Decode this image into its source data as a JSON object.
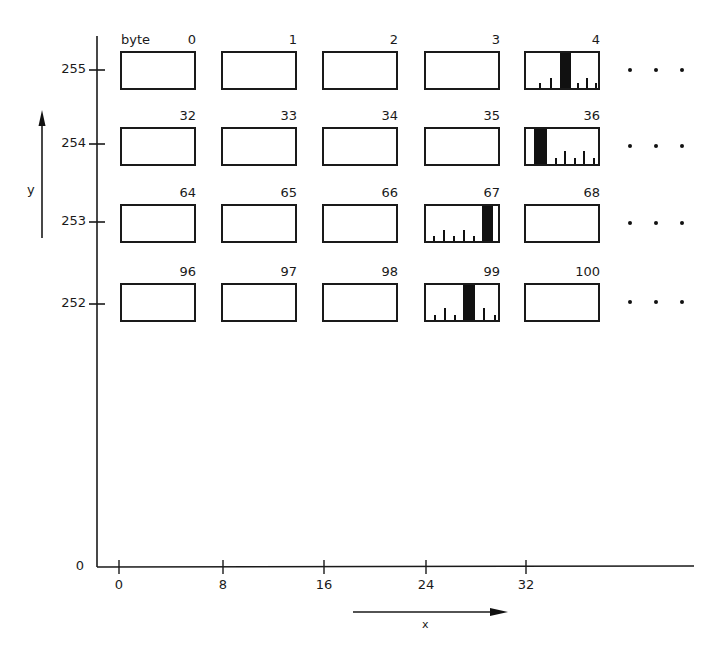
{
  "diagram": {
    "byte_label": "byte",
    "y_axis": {
      "label": "y",
      "ticks": [
        {
          "label": "255",
          "y": 70
        },
        {
          "label": "254",
          "y": 144
        },
        {
          "label": "253",
          "y": 222
        },
        {
          "label": "252",
          "y": 304
        },
        {
          "label": "0",
          "y": 567
        }
      ]
    },
    "x_axis": {
      "label": "x",
      "ticks": [
        {
          "label": "0",
          "x": 119
        },
        {
          "label": "8",
          "x": 223
        },
        {
          "label": "16",
          "x": 324
        },
        {
          "label": "24",
          "x": 426
        },
        {
          "label": "32",
          "x": 526
        }
      ]
    },
    "rows": [
      {
        "y_value": "255",
        "top": 51,
        "bytes": [
          {
            "num": "0"
          },
          {
            "num": "1"
          },
          {
            "num": "2"
          },
          {
            "num": "3"
          },
          {
            "num": "4",
            "pattern": {
              "bar_left": 34,
              "bar_width": 11,
              "ticks": [
                [
                  13,
                  5
                ],
                [
                  24,
                  10
                ],
                [
                  51,
                  5
                ],
                [
                  60,
                  10
                ],
                [
                  69,
                  5
                ]
              ]
            }
          }
        ],
        "ellipsis": "• • •"
      },
      {
        "y_value": "254",
        "top": 127,
        "bytes": [
          {
            "num": "32"
          },
          {
            "num": "33"
          },
          {
            "num": "34"
          },
          {
            "num": "35"
          },
          {
            "num": "36",
            "pattern": {
              "bar_left": 8,
              "bar_width": 13,
              "ticks": [
                [
                  29,
                  6
                ],
                [
                  38,
                  13
                ],
                [
                  48,
                  6
                ],
                [
                  57,
                  13
                ],
                [
                  67,
                  6
                ]
              ]
            }
          }
        ],
        "ellipsis": "• • •"
      },
      {
        "y_value": "253",
        "top": 204,
        "bytes": [
          {
            "num": "64"
          },
          {
            "num": "65"
          },
          {
            "num": "66"
          },
          {
            "num": "67",
            "pattern": {
              "bar_left": 56,
              "bar_width": 11,
              "ticks": [
                [
                  7,
                  5
                ],
                [
                  17,
                  11
                ],
                [
                  27,
                  5
                ],
                [
                  37,
                  11
                ],
                [
                  47,
                  5
                ]
              ]
            }
          },
          {
            "num": "68"
          }
        ],
        "ellipsis": "• • •"
      },
      {
        "y_value": "252",
        "top": 283,
        "bytes": [
          {
            "num": "96"
          },
          {
            "num": "97"
          },
          {
            "num": "98"
          },
          {
            "num": "99",
            "pattern": {
              "bar_left": 37,
              "bar_width": 12,
              "ticks": [
                [
                  8,
                  5
                ],
                [
                  18,
                  12
                ],
                [
                  28,
                  5
                ],
                [
                  57,
                  12
                ],
                [
                  68,
                  5
                ]
              ]
            }
          },
          {
            "num": "100"
          }
        ],
        "ellipsis": "• • •"
      }
    ],
    "column_lefts": [
      120,
      221,
      322,
      424,
      524
    ],
    "box_width": 76,
    "box_height": 39
  }
}
